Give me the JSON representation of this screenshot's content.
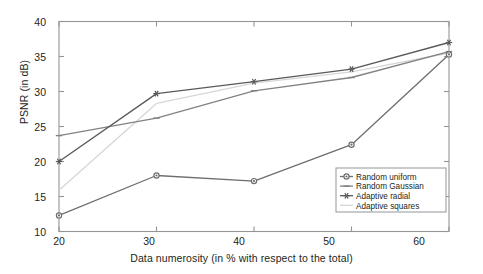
{
  "chart_data": {
    "type": "line",
    "title": "",
    "xlabel": "Data numerosity (in % with respect to the total)",
    "ylabel": "PSNR (in dB)",
    "x": [
      20,
      30,
      40,
      50,
      60
    ],
    "xticklabels": [
      "20",
      "30",
      "40",
      "50",
      "60"
    ],
    "yticklabels": [
      "10",
      "15",
      "20",
      "25",
      "30",
      "35",
      "40"
    ],
    "yticks": [
      10,
      15,
      20,
      25,
      30,
      35,
      40
    ],
    "xlim": [
      20,
      60
    ],
    "ylim": [
      10,
      40
    ],
    "grid": false,
    "legend_position": "lower right",
    "series": [
      {
        "name": "Random uniform",
        "values": [
          12.3,
          18.0,
          17.2,
          22.4,
          35.3
        ],
        "color": "#6d6e71",
        "marker": "circle"
      },
      {
        "name": "Random Gaussian",
        "values": [
          23.7,
          26.2,
          30.1,
          32.0,
          35.7
        ],
        "color": "#808285",
        "marker": "dash"
      },
      {
        "name": "Adaptive radial",
        "values": [
          20.0,
          29.7,
          31.4,
          33.2,
          37.0
        ],
        "color": "#58595b",
        "marker": "asterisk"
      },
      {
        "name": "Adaptive squares",
        "values": [
          15.9,
          28.3,
          31.2,
          32.8,
          35.5
        ],
        "color": "#d5d7d8",
        "marker": "none"
      }
    ]
  },
  "axis": {
    "frame_color": "#939598",
    "tick_color": "#939598",
    "text_color": "#231f20"
  },
  "legend": {
    "border_color": "#939598",
    "background": "#ffffff",
    "entries": [
      {
        "label": "Random uniform"
      },
      {
        "label": "Random Gaussian"
      },
      {
        "label": "Adaptive radial"
      },
      {
        "label": "Adaptive squares"
      }
    ]
  }
}
